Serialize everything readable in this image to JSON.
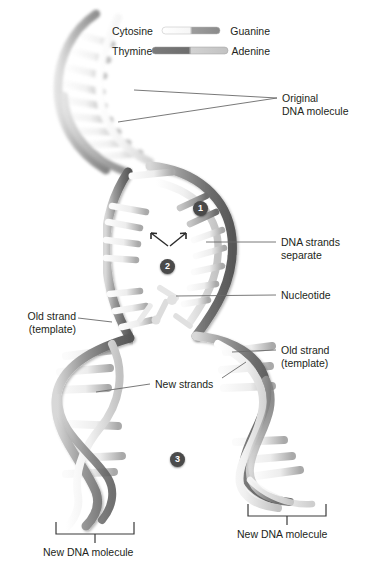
{
  "legend": {
    "pairs": [
      {
        "left_label": "Cytosine",
        "right_label": "Guanine",
        "left_color": "#f2f2f2",
        "right_color": "#8a8a8a",
        "bar_width": 58,
        "bar_x": 50
      },
      {
        "left_label": "Thymine",
        "right_label": "Adenine",
        "left_color": "#6e6e6e",
        "right_color": "#c9c9c9",
        "bar_width": 78,
        "bar_x": 44
      }
    ]
  },
  "callouts": {
    "original_dna": "Original\nDNA molecule",
    "original_dna_line1": "Original",
    "original_dna_line2": "DNA molecule",
    "strands_separate_line1": "DNA strands",
    "strands_separate_line2": "separate",
    "nucleotide": "Nucleotide",
    "old_strand_left_line1": "Old strand",
    "old_strand_left_line2": "(template)",
    "old_strand_right_line1": "Old strand",
    "old_strand_right_line2": "(template)",
    "new_strands": "New strands",
    "new_dna_left": "New DNA molecule",
    "new_dna_right": "New DNA molecule"
  },
  "steps": [
    {
      "number": "1",
      "x": 193,
      "y": 201
    },
    {
      "number": "2",
      "x": 160,
      "y": 259
    },
    {
      "number": "3",
      "x": 170,
      "y": 452
    }
  ],
  "colors": {
    "backbone_dark": "#8d8d8d",
    "backbone_light": "#e8e8e8",
    "rung_light": "#f4f4f4",
    "rung_mid": "#b4b4b4",
    "text": "#231f20",
    "leader": "#5a5a5a",
    "badge_fill": "#4a4a4a"
  }
}
